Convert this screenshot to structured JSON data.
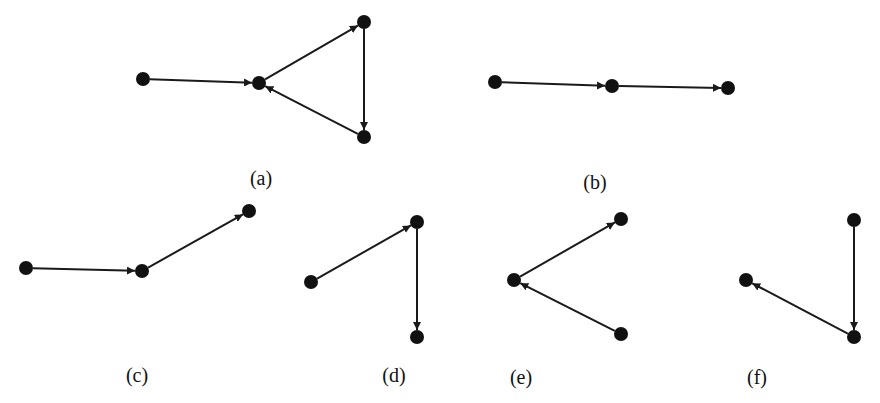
{
  "figure": {
    "colors": {
      "node": "#111111",
      "edge": "#1a1a1a",
      "background": "#ffffff"
    },
    "panels": [
      {
        "id": "a",
        "label": "(a)",
        "label_pos": [
          261,
          168
        ],
        "nodes": [
          [
            143,
            79
          ],
          [
            259,
            83
          ],
          [
            364,
            22
          ],
          [
            364,
            137
          ]
        ],
        "edges": [
          [
            0,
            1
          ],
          [
            1,
            2
          ],
          [
            2,
            3
          ],
          [
            3,
            1
          ]
        ]
      },
      {
        "id": "b",
        "label": "(b)",
        "label_pos": [
          595,
          172
        ],
        "nodes": [
          [
            495,
            82
          ],
          [
            612,
            86
          ],
          [
            728,
            88
          ]
        ],
        "edges": [
          [
            0,
            1
          ],
          [
            1,
            2
          ]
        ]
      },
      {
        "id": "c",
        "label": "(c)",
        "label_pos": [
          137,
          365
        ],
        "nodes": [
          [
            26,
            268
          ],
          [
            142,
            271
          ],
          [
            249,
            211
          ]
        ],
        "edges": [
          [
            0,
            1
          ],
          [
            1,
            2
          ]
        ]
      },
      {
        "id": "d",
        "label": "(d)",
        "label_pos": [
          394,
          365
        ],
        "nodes": [
          [
            311,
            282
          ],
          [
            417,
            222
          ],
          [
            417,
            337
          ]
        ],
        "edges": [
          [
            0,
            1
          ],
          [
            1,
            2
          ]
        ]
      },
      {
        "id": "e",
        "label": "(e)",
        "label_pos": [
          521,
          367
        ],
        "nodes": [
          [
            514,
            280
          ],
          [
            621,
            219
          ],
          [
            621,
            334
          ]
        ],
        "edges": [
          [
            0,
            1
          ],
          [
            2,
            0
          ]
        ]
      },
      {
        "id": "f",
        "label": "(f)",
        "label_pos": [
          757,
          367
        ],
        "nodes": [
          [
            746,
            280
          ],
          [
            854,
            220
          ],
          [
            854,
            337
          ]
        ],
        "edges": [
          [
            1,
            2
          ],
          [
            2,
            0
          ]
        ]
      }
    ]
  }
}
